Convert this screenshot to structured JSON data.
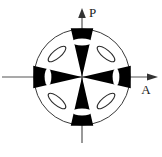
{
  "figure": {
    "background_color": "#ffffff",
    "ink_color": "#000000",
    "circle": {
      "name": "field-of-view-circle",
      "center_x": 82,
      "center_y": 77,
      "radius": 48,
      "stroke_color": "#3a3a3a",
      "stroke_width": 1,
      "fill": "none"
    },
    "axes": {
      "polarizer": {
        "label": "P",
        "label_x": 96,
        "label_y": 16,
        "direction": "vertical",
        "arrow": "up",
        "line_x": 82,
        "line_top": 12,
        "line_bottom": 143,
        "stroke_color": "#555555"
      },
      "analyzer": {
        "label": "A",
        "label_x": 147,
        "label_y": 90,
        "direction": "horizontal",
        "arrow": "right",
        "line_y": 77,
        "line_left": 2,
        "line_right": 158,
        "stroke_color": "#555555"
      }
    },
    "brushes": {
      "name": "isogyre-brushes",
      "count": 4,
      "fill_color": "#000000",
      "description": "Four black wedges (isogyres) meeting at the centre along the P and A vibration directions",
      "items": [
        {
          "name": "brush-top",
          "angle_deg": 90,
          "half_width_deg": 13,
          "inner_radius": 0,
          "outer_radius": 50
        },
        {
          "name": "brush-right",
          "angle_deg": 0,
          "half_width_deg": 13,
          "inner_radius": 0,
          "outer_radius": 50
        },
        {
          "name": "brush-bottom",
          "angle_deg": 270,
          "half_width_deg": 13,
          "inner_radius": 0,
          "outer_radius": 50
        },
        {
          "name": "brush-left",
          "angle_deg": 180,
          "half_width_deg": 13,
          "inner_radius": 0,
          "outer_radius": 50
        }
      ]
    },
    "extinction_bands": {
      "name": "white-extinction-bands",
      "count": 4,
      "fill_color": "#ffffff",
      "description": "White lens-shaped gaps crossing each black brush near its outer end",
      "items": [
        {
          "name": "band-top",
          "cx": 82,
          "cy": 42,
          "rx": 10,
          "ry": 3.4,
          "rotation_deg": 0
        },
        {
          "name": "band-right",
          "cx": 116,
          "cy": 77,
          "rx": 3.4,
          "ry": 9,
          "rotation_deg": 0
        },
        {
          "name": "band-bottom",
          "cx": 82,
          "cy": 112,
          "rx": 10,
          "ry": 3.4,
          "rotation_deg": 0
        },
        {
          "name": "band-left",
          "cx": 48,
          "cy": 77,
          "rx": 3.4,
          "ry": 9,
          "rotation_deg": 0
        }
      ]
    },
    "indicatrix_ellipses": {
      "name": "vibration-direction-ellipses",
      "count": 4,
      "stroke_color": "#2b2b2b",
      "stroke_width": 1,
      "fill": "none",
      "description": "Four small open ellipses in the 45-degree quadrants showing privileged vibration directions",
      "items": [
        {
          "name": "ellipse-upper-left",
          "cx": 57,
          "cy": 54,
          "rx": 11,
          "ry": 4,
          "rotation_deg": -40
        },
        {
          "name": "ellipse-upper-right",
          "cx": 106,
          "cy": 54,
          "rx": 11,
          "ry": 4,
          "rotation_deg": 40
        },
        {
          "name": "ellipse-lower-left",
          "cx": 57,
          "cy": 101,
          "rx": 11,
          "ry": 4,
          "rotation_deg": 40
        },
        {
          "name": "ellipse-lower-right",
          "cx": 106,
          "cy": 101,
          "rx": 11,
          "ry": 4,
          "rotation_deg": -40
        }
      ]
    }
  }
}
